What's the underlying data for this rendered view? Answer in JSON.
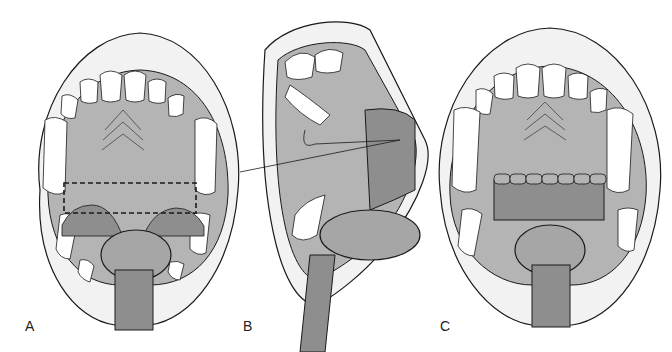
{
  "figure": {
    "panels": [
      {
        "label": "A",
        "description": "open mouth with dashed incision outline across soft palate"
      },
      {
        "label": "B",
        "description": "lateral view with suture through palatal flap"
      },
      {
        "label": "C",
        "description": "sutured soft palate closure"
      }
    ]
  },
  "colors": {
    "lip": "#f2f2f2",
    "palate": "#b4b4b4",
    "dark_tissue": "#8e8e8e",
    "tooth": "#ffffff",
    "line": "#1a1a1a"
  }
}
